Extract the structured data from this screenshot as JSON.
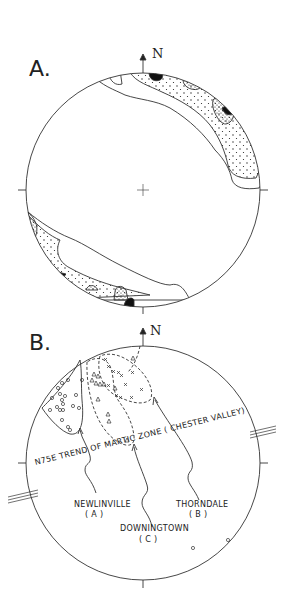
{
  "figure": {
    "panel_a": {
      "label": "A.",
      "north_label": "N",
      "description": "Contoured stereonet with a girdle of point concentrations along the NE and SW margins"
    },
    "panel_b": {
      "label": "B.",
      "north_label": "N",
      "trend_line_label": "N75E  TREND OF MARTIC ZONE  ( CHESTER VALLEY)",
      "groups": [
        {
          "name": "NEWLINVILLE",
          "code": "( A )",
          "symbol": "circle"
        },
        {
          "name": "THORNDALE",
          "code": "( B )",
          "symbol": "cross"
        },
        {
          "name": "DOWNINGTOWN",
          "code": "( C )",
          "symbol": "triangle"
        }
      ]
    }
  }
}
